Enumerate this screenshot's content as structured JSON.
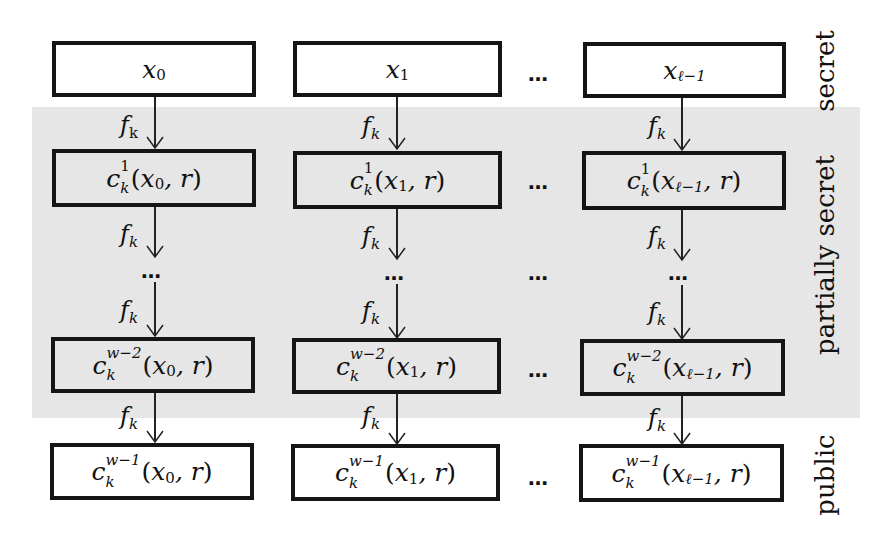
{
  "diagram": {
    "background_color": "#ffffff",
    "shaded_region_color": "#e6e6e6",
    "box_border_color": "#151515",
    "columns": [
      {
        "id": "col0",
        "input": {
          "base": "x",
          "index": "0"
        },
        "rows": [
          {
            "sup": "1",
            "sub": "k",
            "arg_base": "x",
            "arg_index": "0",
            "arg_rest": ", r"
          },
          {
            "sup": "w−2",
            "sub": "k",
            "arg_base": "x",
            "arg_index": "0",
            "arg_rest": ", r"
          },
          {
            "sup": "w−1",
            "sub": "k",
            "arg_base": "x",
            "arg_index": "0",
            "arg_rest": ", r"
          }
        ]
      },
      {
        "id": "col1",
        "input": {
          "base": "x",
          "index": "1"
        },
        "rows": [
          {
            "sup": "1",
            "sub": "k",
            "arg_base": "x",
            "arg_index": "1",
            "arg_rest": ", r"
          },
          {
            "sup": "w−2",
            "sub": "k",
            "arg_base": "x",
            "arg_index": "1",
            "arg_rest": ", r"
          },
          {
            "sup": "w−1",
            "sub": "k",
            "arg_base": "x",
            "arg_index": "1",
            "arg_rest": ", r"
          }
        ]
      },
      {
        "id": "col2",
        "input": {
          "base": "x",
          "index": "ℓ−1"
        },
        "rows": [
          {
            "sup": "1",
            "sub": "k",
            "arg_base": "x",
            "arg_index": "ℓ−1",
            "arg_rest": ", r"
          },
          {
            "sup": "w−2",
            "sub": "k",
            "arg_base": "x",
            "arg_index": "ℓ−1",
            "arg_rest": ", r"
          },
          {
            "sup": "w−1",
            "sub": "k",
            "arg_base": "x",
            "arg_index": "ℓ−1",
            "arg_rest": ", r"
          }
        ]
      }
    ],
    "func_symbol": "c",
    "arrow_label": {
      "base": "f",
      "sub": "k"
    },
    "ellipsis": "…",
    "open_paren": "(",
    "close_paren": ")",
    "side_labels": {
      "top": "secret",
      "middle": "partially secret",
      "bottom": "public"
    }
  }
}
